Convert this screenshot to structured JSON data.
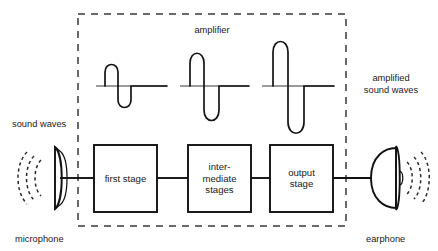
{
  "diagram": {
    "title": "amplifier",
    "labels": {
      "amplifier": "amplifier",
      "sound_waves": "sound waves",
      "amplified_sound_waves_line1": "amplified",
      "amplified_sound_waves_line2": "sound waves",
      "microphone": "microphone",
      "earphone": "earphone"
    },
    "stages": [
      {
        "id": "first-stage",
        "lines": [
          "first stage"
        ]
      },
      {
        "id": "intermediate-stages",
        "lines": [
          "inter-",
          "mediate",
          "stages"
        ]
      },
      {
        "id": "output-stage",
        "lines": [
          "output",
          "stage"
        ]
      }
    ],
    "waveforms": [
      {
        "id": "waveform-1",
        "amplitude_label": "small",
        "relative_amplitude": 1.0
      },
      {
        "id": "waveform-2",
        "amplitude_label": "medium",
        "relative_amplitude": 1.6
      },
      {
        "id": "waveform-3",
        "amplitude_label": "large",
        "relative_amplitude": 2.2
      }
    ],
    "transducers": [
      {
        "id": "microphone",
        "label": "microphone",
        "role": "input"
      },
      {
        "id": "earphone",
        "label": "earphone",
        "role": "output"
      }
    ],
    "colors": {
      "line": "#111111",
      "baseline": "#9b9b9b",
      "dashed_border": "#3a3a3a",
      "text": "#1a1a1a",
      "background": "#ffffff"
    }
  }
}
